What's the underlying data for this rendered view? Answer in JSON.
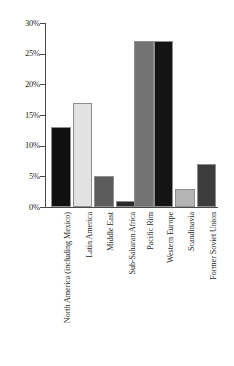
{
  "chart_data": {
    "type": "bar",
    "title": "",
    "xlabel": "",
    "ylabel": "",
    "ylim": [
      0,
      30
    ],
    "ytick_values": [
      30,
      25,
      20,
      15,
      10,
      5,
      0
    ],
    "ytick_labels": [
      "30%",
      "25%",
      "20%",
      "15%",
      "10%",
      "5%",
      "0%"
    ],
    "grid": false,
    "legend": "none",
    "categories": [
      "North America (including Mexico)",
      "Latin America",
      "Middle East",
      "Sub-Saharan Africa",
      "Pacific Rim",
      "Western Europe",
      "Scandinavia",
      "Former Soviet Union"
    ],
    "values": [
      13,
      17,
      5,
      1,
      27,
      27,
      3,
      7
    ],
    "bar_colors": [
      "#101010",
      "#e2e2e2",
      "#5c5c5c",
      "#2a2a2a",
      "#737373",
      "#141414",
      "#b4b4b4",
      "#3c3c3c"
    ],
    "bar_edge_color": "#8e8e8e",
    "axis_color": "#4a4a4a"
  }
}
